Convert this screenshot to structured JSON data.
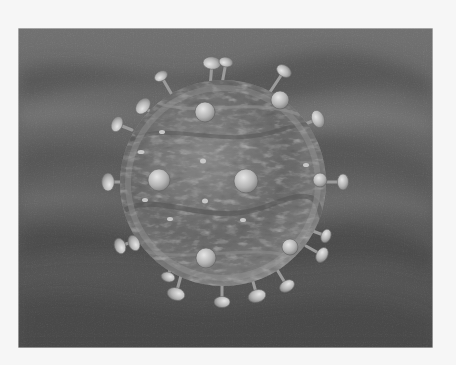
{
  "image": {
    "subject": "3D rendered virus particle (virion) with surface glycoprotein spikes",
    "alt": "Grayscale illustration of a spherical virus with mushroom-shaped spikes on a dark wavy background",
    "palette": {
      "frame": "#f6f6f6",
      "background_dark": "#2e2e2e",
      "background_mid": "#5a5a5a",
      "background_light": "#7a7a7a",
      "sphere_light": "#a8a8a8",
      "sphere_mid": "#6e6e6e",
      "sphere_dark": "#3c3c3c",
      "spike": "#c4c4c4"
    },
    "photo_bounds": {
      "x": 18,
      "y": 28,
      "width": 415,
      "height": 320
    },
    "sphere": {
      "cx": 223,
      "cy": 183,
      "r": 103
    },
    "spikes": [
      {
        "x": 212,
        "y": 63,
        "r": 9,
        "base_x": 210,
        "base_y": 88
      },
      {
        "x": 226,
        "y": 62,
        "r": 7,
        "base_x": 222,
        "base_y": 84
      },
      {
        "x": 284,
        "y": 71,
        "r": 8,
        "base_x": 270,
        "base_y": 92
      },
      {
        "x": 161,
        "y": 76,
        "r": 7,
        "base_x": 175,
        "base_y": 100
      },
      {
        "x": 143,
        "y": 106,
        "r": 9,
        "base_x": 158,
        "base_y": 118
      },
      {
        "x": 117,
        "y": 124,
        "r": 8,
        "base_x": 132,
        "base_y": 130
      },
      {
        "x": 318,
        "y": 119,
        "r": 9,
        "base_x": 300,
        "base_y": 126
      },
      {
        "x": 108,
        "y": 182,
        "r": 9,
        "base_x": 122,
        "base_y": 182
      },
      {
        "x": 343,
        "y": 182,
        "r": 8,
        "base_x": 322,
        "base_y": 182
      },
      {
        "x": 120,
        "y": 246,
        "r": 8,
        "base_x": 138,
        "base_y": 240
      },
      {
        "x": 134,
        "y": 243,
        "r": 8,
        "base_x": 146,
        "base_y": 238
      },
      {
        "x": 326,
        "y": 236,
        "r": 7,
        "base_x": 310,
        "base_y": 230
      },
      {
        "x": 322,
        "y": 255,
        "r": 8,
        "base_x": 306,
        "base_y": 246
      },
      {
        "x": 176,
        "y": 294,
        "r": 9,
        "base_x": 182,
        "base_y": 272
      },
      {
        "x": 222,
        "y": 302,
        "r": 8,
        "base_x": 222,
        "base_y": 281
      },
      {
        "x": 257,
        "y": 296,
        "r": 9,
        "base_x": 252,
        "base_y": 278
      },
      {
        "x": 287,
        "y": 286,
        "r": 8,
        "base_x": 276,
        "base_y": 268
      },
      {
        "x": 168,
        "y": 277,
        "r": 7,
        "base_x": 172,
        "base_y": 262
      }
    ],
    "surface_knobs": [
      {
        "x": 205,
        "y": 112,
        "r": 10
      },
      {
        "x": 280,
        "y": 100,
        "r": 9
      },
      {
        "x": 159,
        "y": 180,
        "r": 11
      },
      {
        "x": 246,
        "y": 181,
        "r": 12
      },
      {
        "x": 206,
        "y": 258,
        "r": 10
      },
      {
        "x": 290,
        "y": 247,
        "r": 8
      },
      {
        "x": 320,
        "y": 180,
        "r": 7
      }
    ]
  }
}
